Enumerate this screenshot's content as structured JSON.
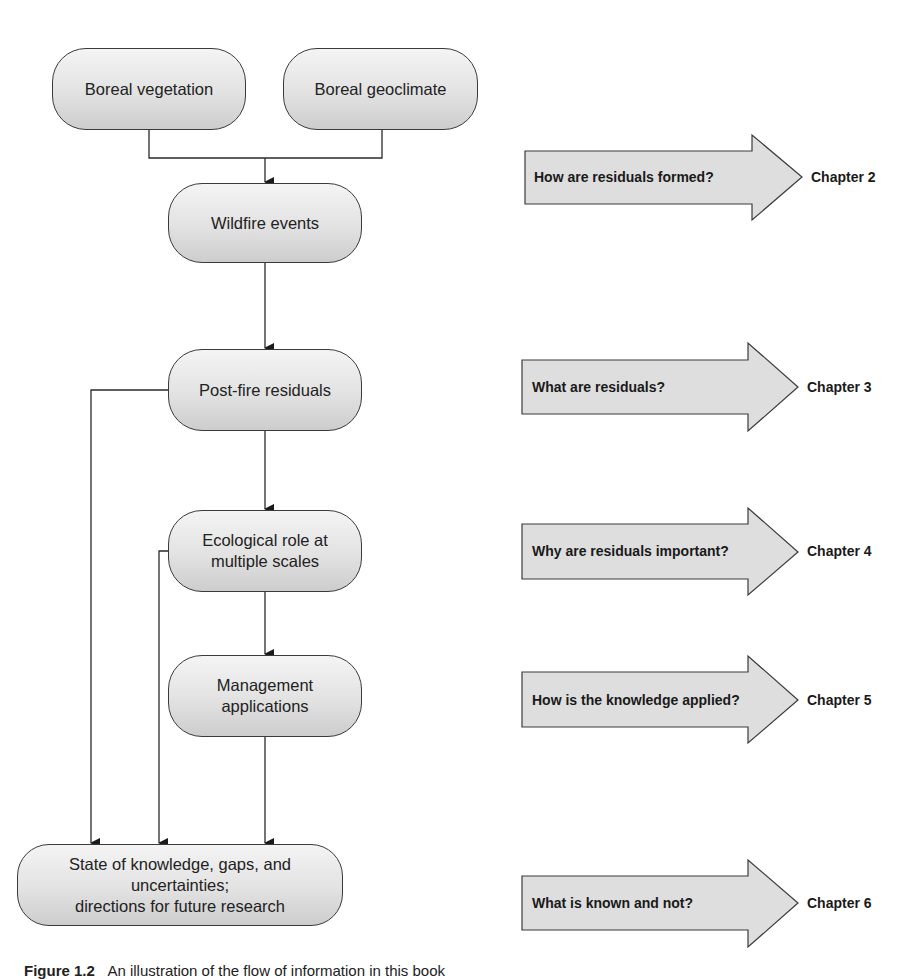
{
  "diagram": {
    "nodes": {
      "boreal_vegetation": "Boreal vegetation",
      "boreal_geoclimate": "Boreal geoclimate",
      "wildfire_events": "Wildfire events",
      "post_fire_residuals": "Post-fire residuals",
      "ecological_role": "Ecological role at\nmultiple scales",
      "management_applications": "Management\napplications",
      "state_of_knowledge": "State of knowledge, gaps, and uncertainties;\ndirections for future research"
    },
    "questions": [
      {
        "question": "How are residuals formed?",
        "chapter": "Chapter 2"
      },
      {
        "question": "What are residuals?",
        "chapter": "Chapter 3"
      },
      {
        "question": "Why are residuals important?",
        "chapter": "Chapter 4"
      },
      {
        "question": "How is the knowledge applied?",
        "chapter": "Chapter 5"
      },
      {
        "question": "What is known and not?",
        "chapter": "Chapter 6"
      }
    ],
    "edges": [
      [
        "Boreal vegetation",
        "Wildfire events"
      ],
      [
        "Boreal geoclimate",
        "Wildfire events"
      ],
      [
        "Wildfire events",
        "Post-fire residuals"
      ],
      [
        "Post-fire residuals",
        "Ecological role at multiple scales"
      ],
      [
        "Post-fire residuals",
        "State of knowledge, gaps, and uncertainties; directions for future research"
      ],
      [
        "Ecological role at multiple scales",
        "Management applications"
      ],
      [
        "Ecological role at multiple scales",
        "State of knowledge, gaps, and uncertainties; directions for future research"
      ],
      [
        "Management applications",
        "State of knowledge, gaps, and uncertainties; directions for future research"
      ]
    ],
    "colors": {
      "node_fill_top": "#f4f4f4",
      "node_fill_bottom": "#cdcdcd",
      "arrow_fill": "#dedede",
      "stroke": "#3a3a3a"
    }
  },
  "caption": {
    "label": "Figure 1.2",
    "text": "An illustration of the flow of information in this book"
  }
}
